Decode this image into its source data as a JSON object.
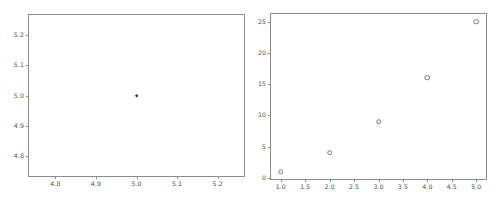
{
  "window": {
    "background_color": "#ffffff",
    "toolbar_strip_color": "#3a3a3a"
  },
  "chart_data": [
    {
      "id": "left-scatter",
      "type": "scatter",
      "title": "",
      "subtitle": "",
      "xlabel": "",
      "ylabel": "",
      "x": [
        5.0
      ],
      "y": [
        5.0
      ],
      "series": [
        {
          "name": "point",
          "x": [
            5.0
          ],
          "y": [
            5.0
          ]
        }
      ],
      "xlim": [
        4.735,
        5.265
      ],
      "ylim": [
        4.735,
        5.265
      ],
      "xticks": [
        4.8,
        4.9,
        5.0,
        5.1,
        5.2
      ],
      "yticks": [
        4.8,
        4.9,
        5.0,
        5.1,
        5.2
      ],
      "xticklabels": [
        "4.8",
        "4.9",
        "5.0",
        "5.1",
        "5.2"
      ],
      "yticklabels": [
        "4.8",
        "4.9",
        "5.0",
        "5.1",
        "5.2"
      ],
      "grid": false,
      "legend": null,
      "marker": "filled-circle",
      "marker_color": "#3f3f3f",
      "spine_color": "#8d8d8d",
      "annotations": []
    },
    {
      "id": "right-scatter",
      "type": "scatter",
      "title": "",
      "subtitle": "",
      "xlabel": "",
      "ylabel": "",
      "x": [
        1,
        2,
        3,
        4,
        5
      ],
      "y": [
        1,
        4,
        9,
        16,
        25
      ],
      "series": [
        {
          "name": "y = x^2",
          "x": [
            1,
            2,
            3,
            4,
            5
          ],
          "y": [
            1,
            4,
            9,
            16,
            25
          ]
        }
      ],
      "xlim": [
        0.8,
        5.2
      ],
      "ylim": [
        -0.2,
        26.2
      ],
      "xticks": [
        1.0,
        1.5,
        2.0,
        2.5,
        3.0,
        3.5,
        4.0,
        4.5,
        5.0
      ],
      "yticks": [
        0,
        5,
        10,
        15,
        20,
        25
      ],
      "xticklabels": [
        "1.0",
        "1.5",
        "2.0",
        "2.5",
        "3.0",
        "3.5",
        "4.0",
        "4.5",
        "5.0"
      ],
      "yticklabels": [
        "0",
        "5",
        "10",
        "15",
        "20",
        "25"
      ],
      "grid": false,
      "legend": null,
      "marker": "open-circle",
      "marker_color": "#7a7a7a",
      "spine_color": "#8d8d8d",
      "annotations": []
    }
  ]
}
